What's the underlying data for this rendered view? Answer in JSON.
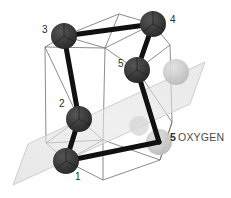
{
  "figure": {
    "background_color": "#ffffff"
  },
  "colors": {
    "atom_dark": "#3a3a3a",
    "atom_dark_shade": "#2a2a2a",
    "atom_ghost": "#c9c9c9",
    "bond_thick": "#111111",
    "cage_line": "#6e6e6e",
    "plane_fill": "#e2e2e2",
    "plane_stroke": "#c4c4c4",
    "label_text": "#2b2b2b",
    "legend_text": "#4a4a4a"
  },
  "atoms": [
    {
      "id": "atom-1",
      "label": "1",
      "cx": 66,
      "cy": 161,
      "r": 13,
      "kind": "dark",
      "label_x": 75,
      "label_y": 176
    },
    {
      "id": "atom-2",
      "label": "2",
      "cx": 79,
      "cy": 119,
      "r": 13,
      "kind": "dark",
      "label_x": 59,
      "label_y": 104
    },
    {
      "id": "atom-3",
      "label": "3",
      "cx": 64,
      "cy": 36,
      "r": 13,
      "kind": "dark",
      "label_x": 42,
      "label_y": 30
    },
    {
      "id": "atom-4",
      "label": "4",
      "cx": 153,
      "cy": 24,
      "r": 13,
      "kind": "dark",
      "label_x": 170,
      "label_y": 20
    },
    {
      "id": "atom-5",
      "label": "5",
      "cx": 137,
      "cy": 70,
      "r": 13,
      "kind": "dark",
      "label_x": 118,
      "label_y": 64
    }
  ],
  "ghost_atoms": [
    {
      "id": "ghost-oxygen-upper",
      "cx": 176,
      "cy": 72,
      "r": 13
    },
    {
      "id": "ghost-oxygen-lower",
      "cx": 159,
      "cy": 142,
      "r": 13
    },
    {
      "id": "ghost-oxygen-mid",
      "cx": 139,
      "cy": 126,
      "r": 10
    }
  ],
  "bonds": [
    {
      "from": "atom-3",
      "to": "atom-4",
      "width": 5
    },
    {
      "from": "atom-3",
      "to": "atom-2",
      "width": 5
    },
    {
      "from": "atom-2",
      "to": "atom-1",
      "width": 5
    },
    {
      "from": "atom-4",
      "to": "atom-5",
      "width": 5
    },
    {
      "from": "atom-5",
      "to": "ghost-oxygen-lower",
      "width": 5
    },
    {
      "from": "atom-1",
      "to": "ghost-oxygen-lower",
      "width": 5
    }
  ],
  "cage_vertices": {
    "top_back": {
      "x": 119,
      "y": 14
    },
    "top_front": {
      "x": 105,
      "y": 48
    },
    "left_upper": {
      "x": 45,
      "y": 47
    },
    "left_lower": {
      "x": 46,
      "y": 143
    },
    "mid_front": {
      "x": 103,
      "y": 140
    },
    "right_upper": {
      "x": 170,
      "y": 45
    },
    "right_lower": {
      "x": 172,
      "y": 122
    },
    "bottom_front": {
      "x": 103,
      "y": 180
    },
    "bottom_right": {
      "x": 160,
      "y": 160
    }
  },
  "plane": {
    "name": "cutting-plane",
    "points": "13,185 28,144 205,62 190,104",
    "opacity": 0.55
  },
  "legend": {
    "number": "5",
    "label": "OXYGEN"
  }
}
